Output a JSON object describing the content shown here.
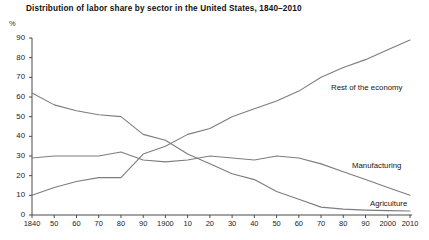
{
  "chart_data": {
    "type": "line",
    "title": "Distribution of labor share by sector in the United States, 1840–2010",
    "xlabel": "",
    "ylabel": "%",
    "ylim": [
      0,
      90
    ],
    "yticks": [
      0,
      10,
      20,
      30,
      40,
      50,
      60,
      70,
      80,
      90
    ],
    "xlim": [
      1840,
      2010
    ],
    "grid": false,
    "legend_position": "inline-right",
    "x": [
      1840,
      1850,
      1860,
      1870,
      1880,
      1890,
      1900,
      1910,
      1920,
      1930,
      1940,
      1950,
      1960,
      1970,
      1980,
      1990,
      2000,
      2010
    ],
    "xticklabels": [
      "1840",
      "50",
      "60",
      "70",
      "80",
      "90",
      "1900",
      "10",
      "20",
      "30",
      "40",
      "50",
      "60",
      "70",
      "80",
      "90",
      "2000",
      "2010"
    ],
    "series": [
      {
        "name": "Agriculture",
        "values": [
          62,
          56,
          53,
          51,
          50,
          41,
          38,
          31,
          26,
          21,
          18,
          12,
          8,
          4,
          3,
          2.5,
          2.2,
          2
        ]
      },
      {
        "name": "Manufacturing",
        "values": [
          29,
          30,
          30,
          30,
          32,
          28,
          27,
          28,
          30,
          29,
          28,
          30,
          29,
          26,
          22,
          18,
          14,
          10
        ]
      },
      {
        "name": "Rest of the economy",
        "values": [
          10,
          14,
          17,
          19,
          19,
          31,
          35,
          41,
          44,
          50,
          54,
          58,
          63,
          70,
          75,
          79,
          84,
          89
        ]
      }
    ],
    "annotations": [
      {
        "text": "Rest of the economy",
        "x_px": 331,
        "y_px": 83
      },
      {
        "text": "Manufacturing",
        "x_px": 352,
        "y_px": 161
      },
      {
        "text": "Agriculture",
        "x_px": 370,
        "y_px": 199
      }
    ],
    "colors": {
      "line": "#7d7d7d",
      "axis": "#4a4a4a",
      "text": "#1a1a1a",
      "background": "#ffffff"
    },
    "plot_area_px": {
      "left": 32,
      "right": 410,
      "top": 38,
      "bottom": 215
    }
  }
}
